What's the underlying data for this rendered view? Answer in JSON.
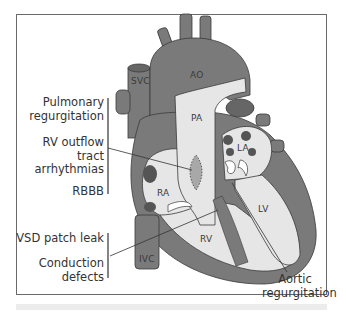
{
  "diagram": {
    "structures": {
      "svc": "SVC",
      "ao": "AO",
      "pa": "PA",
      "la": "LA",
      "ra": "RA",
      "lv": "LV",
      "rv": "RV",
      "ivc": "IVC"
    },
    "left_labels": {
      "group1": {
        "pulmonary_regurgitation": [
          "Pulmonary",
          "regurgitation"
        ],
        "rv_outflow": [
          "RV outflow",
          "tract",
          "arrhythmias"
        ],
        "rbbb": "RBBB"
      },
      "group2": {
        "vsd_patch_leak": "VSD patch leak",
        "conduction_defects": [
          "Conduction",
          "defects"
        ]
      }
    },
    "right_labels": {
      "aortic_regurgitation": [
        "Aortic",
        "regurgitation"
      ]
    },
    "colors": {
      "muscle": "#7a7a7a",
      "chamber": "#e6e6e6",
      "outline": "#3a3a3a",
      "dark_spot": "#555555",
      "patch": "#a8a8a8"
    }
  }
}
